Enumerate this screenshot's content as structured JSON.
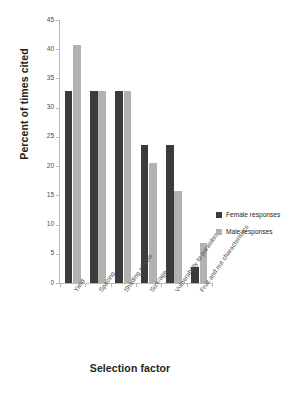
{
  "chart_data": {
    "type": "bar",
    "title": "",
    "xlabel": "Selection factor",
    "ylabel": "Percent of times cited",
    "categories": [
      "Yield",
      "Spacing",
      "Shading effects",
      "Size/age",
      "Vulnerability to parasites",
      "Fruit and nut characteristics"
    ],
    "series": [
      {
        "name": "Female responses",
        "color": "#3c3a3a",
        "values": [
          32.8,
          32.8,
          32.8,
          23.7,
          23.7,
          2.7
        ]
      },
      {
        "name": "Male responses",
        "color": "#b2b2b2",
        "values": [
          40.7,
          32.8,
          32.8,
          20.6,
          15.7,
          6.8
        ]
      }
    ],
    "ylim": [
      0,
      45
    ],
    "ytick_labels": [
      "0",
      "5",
      "10",
      "15",
      "20",
      "25",
      "30",
      "35",
      "40",
      "45"
    ],
    "ytick_values": [
      0,
      5,
      10,
      15,
      20,
      25,
      30,
      35,
      40,
      45
    ],
    "grid": false,
    "legend_position": "right"
  },
  "legend": {
    "entries": [
      {
        "label": "Female responses"
      },
      {
        "label": "Male responses"
      }
    ]
  }
}
